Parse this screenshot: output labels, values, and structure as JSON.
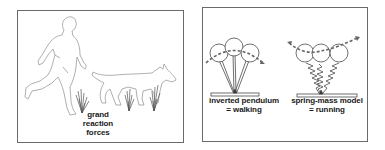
{
  "figure": {
    "left_panel": {
      "subjects": [
        "human-runner",
        "dog"
      ],
      "label_lines": [
        "grand",
        "reaction",
        "forces"
      ]
    },
    "right_panel": {
      "models": [
        {
          "name": "inverted-pendulum",
          "label_lines": [
            "inverted pendulum",
            "= walking"
          ]
        },
        {
          "name": "spring-mass",
          "label_lines": [
            "spring-mass model",
            "= running"
          ]
        }
      ]
    },
    "colors": {
      "outline": "#8a8a8a",
      "frame": "#6a6a6a",
      "text": "#1a1a1a",
      "force_vectors": "#555555"
    }
  }
}
